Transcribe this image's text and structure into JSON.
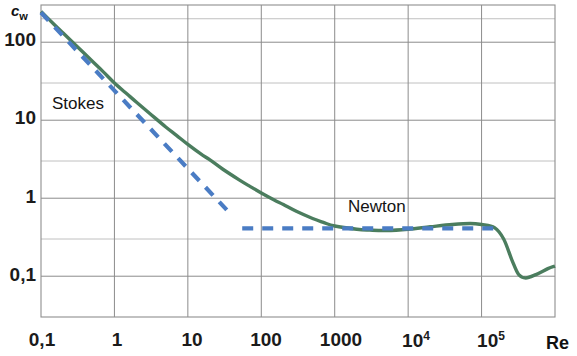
{
  "chart_data": {
    "type": "line",
    "title": "",
    "subtitle": "",
    "xlabel": "Re",
    "ylabel": "c_w",
    "xscale": "log",
    "yscale": "log",
    "xlim": [
      0.1,
      1000000
    ],
    "ylim": [
      0.03,
      300
    ],
    "grid": true,
    "legend": "none",
    "x_tick_labels": [
      "0,1",
      "1",
      "10",
      "100",
      "1000",
      "10",
      "10"
    ],
    "x_tick_exponents": [
      "",
      "",
      "",
      "",
      "",
      "4",
      "5"
    ],
    "x_tick_values": [
      0.1,
      1,
      10,
      100,
      1000,
      10000,
      100000
    ],
    "y_tick_labels": [
      "100",
      "10",
      "1",
      "0,1"
    ],
    "y_tick_values": [
      100,
      10,
      1,
      0.1
    ],
    "y_minor_gridline_values": [
      200,
      30,
      3,
      0.3,
      0.03
    ],
    "annotations": [
      {
        "text": "Stokes",
        "x": 0.42,
        "y": 13.5,
        "color": "#141414"
      },
      {
        "text": "Newton",
        "x": 400,
        "y": 0.72,
        "color": "#141414"
      }
    ],
    "series": [
      {
        "name": "drag coefficient sphere",
        "style": "solid",
        "color": "#4b7d5e",
        "width": 3.4,
        "points": [
          {
            "x": 0.1,
            "y": 248
          },
          {
            "x": 0.15,
            "y": 170
          },
          {
            "x": 0.2,
            "y": 131
          },
          {
            "x": 0.3,
            "y": 91
          },
          {
            "x": 0.5,
            "y": 57
          },
          {
            "x": 0.7,
            "y": 42
          },
          {
            "x": 1.0,
            "y": 30
          },
          {
            "x": 1.5,
            "y": 21.5
          },
          {
            "x": 2.0,
            "y": 17.0
          },
          {
            "x": 3.0,
            "y": 12.3
          },
          {
            "x": 5.0,
            "y": 8.2
          },
          {
            "x": 7.0,
            "y": 6.4
          },
          {
            "x": 10,
            "y": 4.9
          },
          {
            "x": 15,
            "y": 3.7
          },
          {
            "x": 20,
            "y": 3.1
          },
          {
            "x": 30,
            "y": 2.35
          },
          {
            "x": 50,
            "y": 1.72
          },
          {
            "x": 70,
            "y": 1.42
          },
          {
            "x": 100,
            "y": 1.17
          },
          {
            "x": 150,
            "y": 0.95
          },
          {
            "x": 200,
            "y": 0.83
          },
          {
            "x": 300,
            "y": 0.68
          },
          {
            "x": 500,
            "y": 0.55
          },
          {
            "x": 700,
            "y": 0.49
          },
          {
            "x": 1000,
            "y": 0.44
          },
          {
            "x": 2000,
            "y": 0.4
          },
          {
            "x": 3000,
            "y": 0.39
          },
          {
            "x": 5000,
            "y": 0.385
          },
          {
            "x": 10000,
            "y": 0.4
          },
          {
            "x": 20000,
            "y": 0.43
          },
          {
            "x": 40000,
            "y": 0.46
          },
          {
            "x": 70000,
            "y": 0.475
          },
          {
            "x": 100000,
            "y": 0.46
          },
          {
            "x": 150000,
            "y": 0.42
          },
          {
            "x": 200000,
            "y": 0.3
          },
          {
            "x": 260000,
            "y": 0.16
          },
          {
            "x": 320000,
            "y": 0.105
          },
          {
            "x": 400000,
            "y": 0.095
          },
          {
            "x": 550000,
            "y": 0.105
          },
          {
            "x": 800000,
            "y": 0.125
          },
          {
            "x": 1000000,
            "y": 0.135
          }
        ]
      },
      {
        "name": "Stokes law asymptote",
        "style": "dashed",
        "color": "#4a7cc4",
        "width": 4.2,
        "points": [
          {
            "x": 0.1,
            "y": 240
          },
          {
            "x": 40,
            "y": 0.6
          }
        ]
      },
      {
        "name": "Newton law asymptote",
        "style": "dashed",
        "color": "#4a7cc4",
        "width": 4.2,
        "points": [
          {
            "x": 55,
            "y": 0.41
          },
          {
            "x": 170000,
            "y": 0.41
          }
        ]
      }
    ]
  },
  "axes": {
    "y_label_text": "c",
    "y_label_sub": "w",
    "x_label_text": "Re"
  }
}
